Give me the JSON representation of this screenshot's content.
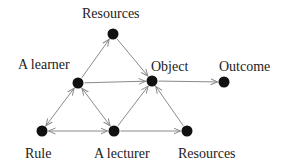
{
  "diagram": {
    "colors": {
      "node": "#111111",
      "edge": "#8a8a8a",
      "text": "#222222"
    },
    "nodes": [
      {
        "id": "resources_top",
        "label": "Resources",
        "x": 113,
        "y": 34,
        "lx": 82,
        "ly": 7
      },
      {
        "id": "learner",
        "label": "A learner",
        "x": 78,
        "y": 83,
        "lx": 18,
        "ly": 58
      },
      {
        "id": "object",
        "label": "Object",
        "x": 152,
        "y": 81,
        "lx": 151,
        "ly": 60
      },
      {
        "id": "outcome",
        "label": "Outcome",
        "x": 224,
        "y": 82,
        "lx": 219,
        "ly": 60
      },
      {
        "id": "rule",
        "label": "Rule",
        "x": 42,
        "y": 131,
        "lx": 25,
        "ly": 147
      },
      {
        "id": "lecturer",
        "label": "A lecturer",
        "x": 114,
        "y": 131,
        "lx": 94,
        "ly": 147
      },
      {
        "id": "resources_bottom",
        "label": "Resources",
        "x": 187,
        "y": 131,
        "lx": 178,
        "ly": 147
      }
    ],
    "edges": [
      {
        "from": "learner",
        "to": "resources_top",
        "bidirectional": false
      },
      {
        "from": "resources_top",
        "to": "object",
        "bidirectional": false
      },
      {
        "from": "learner",
        "to": "object",
        "bidirectional": false
      },
      {
        "from": "object",
        "to": "outcome",
        "bidirectional": false
      },
      {
        "from": "learner",
        "to": "rule",
        "bidirectional": true
      },
      {
        "from": "learner",
        "to": "lecturer",
        "bidirectional": true
      },
      {
        "from": "rule",
        "to": "lecturer",
        "bidirectional": true
      },
      {
        "from": "lecturer",
        "to": "object",
        "bidirectional": false
      },
      {
        "from": "lecturer",
        "to": "resources_bottom",
        "bidirectional": false
      },
      {
        "from": "resources_bottom",
        "to": "object",
        "bidirectional": false
      }
    ]
  }
}
